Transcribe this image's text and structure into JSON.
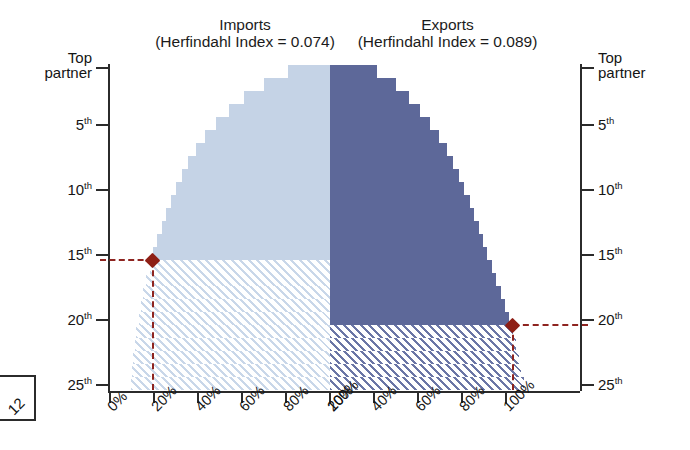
{
  "figure": {
    "top_cut_text": "",
    "corner_label": "12",
    "panels": {
      "imports": {
        "name": "Imports",
        "index_line": "(Herfindahl Index = 0.074)"
      },
      "exports": {
        "name": "Exports",
        "index_line": "(Herfindahl Index = 0.089)"
      }
    }
  },
  "colors": {
    "imports_fill": "#c5d3e6",
    "exports_fill": "#5d6899",
    "imports_hatch": "#c9d7e9",
    "exports_hatch": "#6b76a6",
    "marker": "#8e1f15",
    "axis": "#2b2b2b"
  },
  "axis": {
    "y_labels_top": "Top\npartner",
    "y_top_line1": "Top",
    "y_top_line2": "partner",
    "y_ticks": [
      "5",
      "10",
      "15",
      "20",
      "25"
    ],
    "y_suffix": "th",
    "x_labels_left": [
      "100%",
      "80%",
      "60%",
      "40%",
      "20%",
      "0%"
    ],
    "x_labels_right": [
      "0%",
      "20%",
      "40%",
      "60%",
      "80%",
      "100%"
    ]
  },
  "chart_data": {
    "type": "area",
    "subtitle": "Imports (Herfindahl Index = 0.074) / Exports (Herfindahl Index = 0.089)",
    "xlabel": "Cumulative share of trade",
    "ylabel": "Partner rank",
    "orientation": "back-to-back stepped cumulative (Lorenz) curves",
    "xlim": [
      0,
      100
    ],
    "ylim": [
      1,
      25
    ],
    "grid": false,
    "legend": "none",
    "ranks": [
      1,
      2,
      3,
      4,
      5,
      6,
      7,
      8,
      9,
      10,
      11,
      12,
      13,
      14,
      15,
      16,
      17,
      18,
      19,
      20,
      21,
      22,
      23,
      24,
      25
    ],
    "series": [
      {
        "name": "Imports",
        "herfindahl_index": 0.074,
        "side": "left",
        "color": "#c5d3e6",
        "cumulative_percent": [
          19,
          30,
          39,
          46,
          52,
          57,
          61,
          64.5,
          67.5,
          70,
          72.5,
          74.5,
          76.5,
          78.5,
          80.5,
          82,
          83.5,
          85,
          86,
          87,
          88,
          88.8,
          89.5,
          90.1,
          90.6
        ],
        "marker": {
          "rank": 15,
          "rank_label": "15th",
          "cumulative_percent": 80.5
        },
        "hatched_below_rank": 15
      },
      {
        "name": "Exports",
        "herfindahl_index": 0.089,
        "side": "right",
        "color": "#5d6899",
        "cumulative_percent": [
          21.5,
          30,
          36,
          41,
          45.5,
          49.5,
          53,
          56,
          58.5,
          61,
          63.5,
          65.5,
          67.5,
          69.5,
          71.5,
          73.5,
          75.5,
          77.5,
          79.5,
          81.5,
          83,
          84.5,
          85.8,
          87,
          88
        ],
        "marker": {
          "rank": 20,
          "rank_label": "20th",
          "cumulative_percent": 83
        },
        "hatched_below_rank": 20
      }
    ],
    "annotations": [
      {
        "text": "15th",
        "side": "left",
        "series": "Imports",
        "rank": 15,
        "cumulative_percent": 80.5,
        "style": "dashed-leader-with-diamond"
      },
      {
        "text": "20th",
        "side": "right",
        "series": "Exports",
        "rank": 20,
        "cumulative_percent": 83,
        "style": "dashed-leader-with-diamond"
      }
    ]
  }
}
